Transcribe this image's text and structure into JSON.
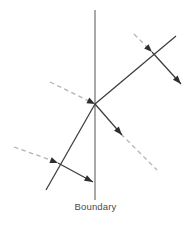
{
  "figure": {
    "kind": "optics-ray-diagram",
    "title": "",
    "background_color": "#ffffff",
    "width": 191,
    "height": 225
  },
  "labels": {
    "boundary": "Boundary"
  },
  "colors": {
    "solid_ray": "#3d3d3d",
    "dashed_normal": "#b3b3b3",
    "boundary_line": "#7a7a7a",
    "label_text": "#4a4a4a",
    "arrow_head": "#2e2e2e"
  },
  "geometry": {
    "boundary": {
      "x": 95,
      "y_top": 10,
      "y_bottom": 200
    },
    "points": {
      "main_interface": {
        "x": 95,
        "y": 104
      },
      "upper_right_crossing": {
        "x": 152,
        "y": 52
      },
      "lower_left_crossing": {
        "x": 58,
        "y": 163
      }
    },
    "solid_rays": [
      {
        "name": "incident-ray-from-lower-left",
        "x1": 46,
        "y1": 190,
        "x2": 95,
        "y2": 104
      },
      {
        "name": "transmitted-ray-upper-right",
        "x1": 95,
        "y1": 104,
        "x2": 176,
        "y2": 36
      },
      {
        "name": "reflected-ray-lower-right",
        "x1": 95,
        "y1": 104,
        "x2": 122,
        "y2": 135
      },
      {
        "name": "secondary-ray-lower-left-outgoing",
        "x1": 58,
        "y1": 163,
        "x2": 93,
        "y2": 182
      },
      {
        "name": "secondary-ray-upper-right-outgoing",
        "x1": 152,
        "y1": 52,
        "x2": 181,
        "y2": 84
      }
    ],
    "dashed_normals": [
      {
        "name": "normal-main-interface",
        "x1": 50,
        "y1": 82,
        "x2": 97,
        "y2": 106
      },
      {
        "name": "normal-lower-left",
        "x1": 14,
        "y1": 147,
        "x2": 60,
        "y2": 165
      },
      {
        "name": "normal-upper-right",
        "x1": 134,
        "y1": 34,
        "x2": 154,
        "y2": 54
      },
      {
        "name": "extension-lower-right",
        "x1": 120,
        "y1": 133,
        "x2": 156,
        "y2": 169
      }
    ],
    "arrow_heads": [
      {
        "name": "arrowhead-into-main-interface",
        "x": 95,
        "y": 104,
        "angle_deg": 27
      },
      {
        "name": "arrowhead-into-lower-left-crossing",
        "x": 58,
        "y": 163,
        "angle_deg": 21
      },
      {
        "name": "arrowhead-into-upper-right-crossing",
        "x": 152,
        "y": 52,
        "angle_deg": 45
      },
      {
        "name": "arrowhead-reflected-lower-right",
        "x": 122,
        "y": 135,
        "angle_deg": 49
      },
      {
        "name": "arrowhead-secondary-lower-left",
        "x": 93,
        "y": 182,
        "angle_deg": 28
      },
      {
        "name": "arrowhead-secondary-upper-right",
        "x": 181,
        "y": 84,
        "angle_deg": 48
      }
    ]
  }
}
